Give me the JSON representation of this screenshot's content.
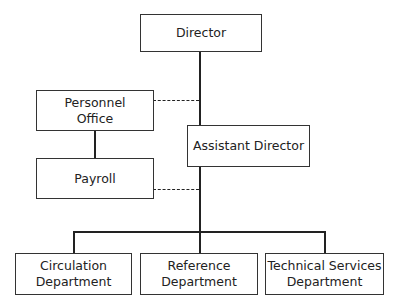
{
  "chart": {
    "type": "org-chart",
    "nodes": [
      {
        "id": "director",
        "label": "Director"
      },
      {
        "id": "personnel",
        "label": "Personnel Office",
        "lines": [
          "Personnel",
          "Office"
        ]
      },
      {
        "id": "assistant",
        "label": "Assistant Director"
      },
      {
        "id": "payroll",
        "label": "Payroll"
      },
      {
        "id": "circulation",
        "label": "Circulation Department",
        "lines": [
          "Circulation",
          "Department"
        ]
      },
      {
        "id": "reference",
        "label": "Reference Department",
        "lines": [
          "Reference",
          "Department"
        ]
      },
      {
        "id": "technical",
        "label": "Technical Services Department",
        "lines": [
          "Technical Services",
          "Department"
        ]
      }
    ],
    "edges": [
      {
        "from": "director",
        "to": "assistant",
        "style": "solid"
      },
      {
        "from": "personnel",
        "to": "director-line",
        "style": "dashed"
      },
      {
        "from": "personnel",
        "to": "payroll",
        "style": "solid"
      },
      {
        "from": "payroll",
        "to": "assistant-line",
        "style": "dashed"
      },
      {
        "from": "assistant",
        "to": "circulation",
        "style": "solid"
      },
      {
        "from": "assistant",
        "to": "reference",
        "style": "solid"
      },
      {
        "from": "assistant",
        "to": "technical",
        "style": "solid"
      }
    ]
  }
}
